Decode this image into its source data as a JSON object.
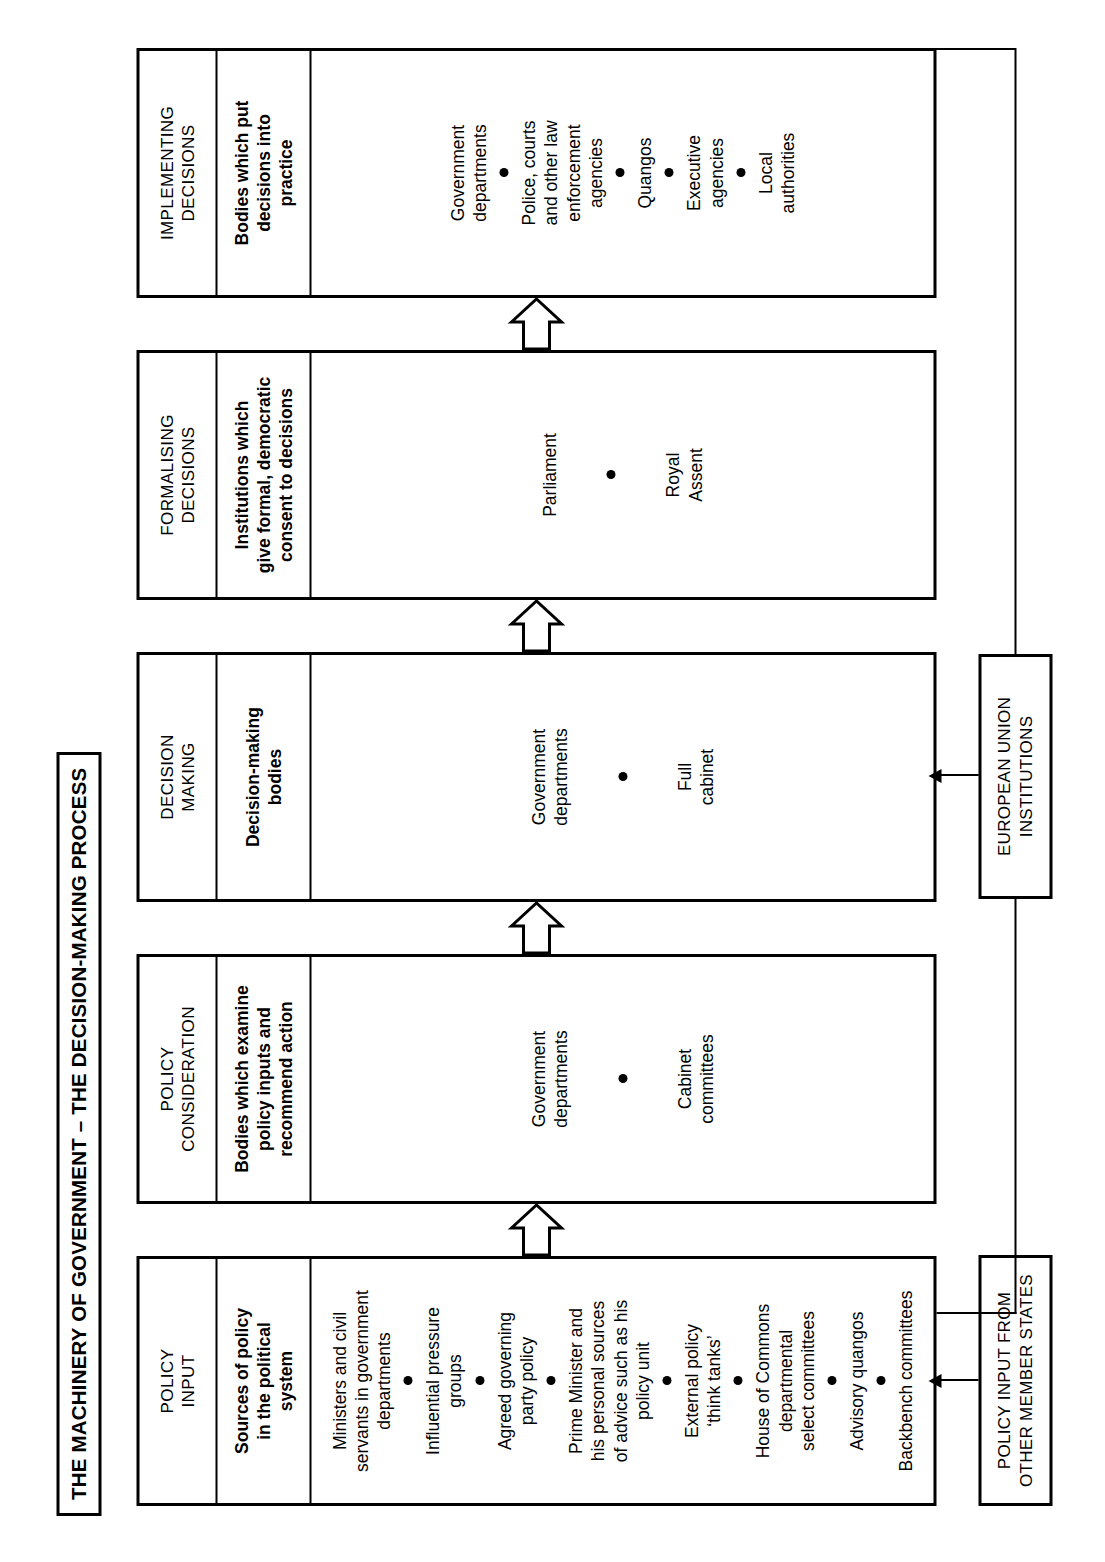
{
  "title": "THE MACHINERY OF GOVERNMENT – THE DECISION-MAKING PROCESS",
  "columns": [
    {
      "header": "POLICY\nINPUT",
      "subheader": "Sources of policy\nin the political\nsystem",
      "density": "dense",
      "items": [
        "Ministers and civil\nservants in government\ndepartments",
        "Influential pressure\ngroups",
        "Agreed governing\nparty policy",
        "Prime Minister and\nhis personal sources\nof advice such as his\npolicy unit",
        "External policy\n‘think tanks’",
        "House of Commons\ndepartmental\nselect committees",
        "Advisory quangos",
        "Backbench committees"
      ]
    },
    {
      "header": "POLICY\nCONSIDERATION",
      "subheader": "Bodies which examine\npolicy inputs and\nrecommend action",
      "density": "sparse",
      "items": [
        "Government\ndepartments",
        "Cabinet\ncommittees"
      ]
    },
    {
      "header": "DECISION\nMAKING",
      "subheader": "Decision-making\nbodies",
      "density": "sparse",
      "items": [
        "Government\ndepartments",
        "Full\ncabinet"
      ]
    },
    {
      "header": "FORMALISING\nDECISIONS",
      "subheader": "Institutions which\ngive formal, democratic\nconsent to decisions",
      "density": "sparse",
      "items": [
        "Parliament",
        "Royal\nAssent"
      ]
    },
    {
      "header": "IMPLEMENTING\nDECISIONS",
      "subheader": "Bodies which put\ndecisions into\npractice",
      "density": "dense",
      "items": [
        "Government\ndepartments",
        "Police, courts\nand other law\nenforcement\nagencies",
        "Quangos",
        "Executive\nagencies",
        "Local\nauthorities"
      ]
    }
  ],
  "side_boxes": {
    "european_union": "EUROPEAN UNION\nINSTITUTIONS",
    "member_states": "POLICY INPUT FROM\nOTHER MEMBER STATES"
  },
  "flow_arrows": [
    {
      "name": "input-to-consideration"
    },
    {
      "name": "consideration-to-decision"
    },
    {
      "name": "decision-to-formalising"
    },
    {
      "name": "formalising-to-implementing"
    }
  ],
  "colors": {
    "stroke": "#000000",
    "background": "#ffffff"
  }
}
